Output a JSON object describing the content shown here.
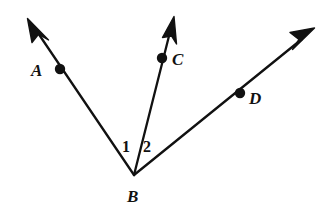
{
  "figure": {
    "background_color": "#ffffff",
    "stroke_color": "#111111",
    "stroke_width": 2.2,
    "width": 330,
    "height": 215
  },
  "vertex": {
    "name": "B",
    "label": "B",
    "x": 134,
    "y": 175,
    "label_x": 127,
    "label_y": 188
  },
  "rays": [
    {
      "id": "ray-ba",
      "label": "A",
      "from_x": 134,
      "from_y": 175,
      "tip_x": 28,
      "tip_y": 19,
      "dot_x": 60,
      "dot_y": 69,
      "dot_radius": 5.2,
      "label_x": 31,
      "label_y": 62,
      "arrowhead": true
    },
    {
      "id": "ray-bc",
      "label": "C",
      "from_x": 134,
      "from_y": 175,
      "tip_x": 174,
      "tip_y": 17,
      "dot_x": 162,
      "dot_y": 58,
      "dot_radius": 5.2,
      "label_x": 172,
      "label_y": 51,
      "arrowhead": true
    },
    {
      "id": "ray-bd",
      "label": "D",
      "from_x": 134,
      "from_y": 175,
      "tip_x": 314,
      "tip_y": 29,
      "dot_x": 240,
      "dot_y": 93,
      "dot_radius": 5.2,
      "label_x": 249,
      "label_y": 90,
      "arrowhead": true
    }
  ],
  "angles": [
    {
      "id": "angle-1",
      "label": "1",
      "label_x": 122,
      "label_y": 139,
      "between": "ray-ba and ray-bc"
    },
    {
      "id": "angle-2",
      "label": "2",
      "label_x": 143,
      "label_y": 139,
      "between": "ray-bc and ray-bd"
    }
  ]
}
